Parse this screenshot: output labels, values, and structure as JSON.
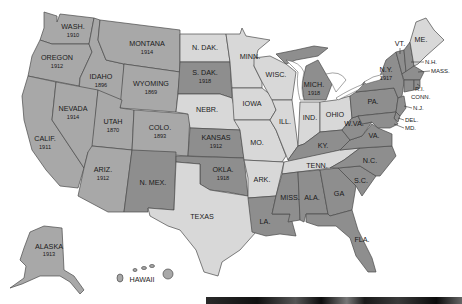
{
  "colors": {
    "full_suffrage": "#a8a8a8",
    "later_suffrage": "#8e8e8e",
    "no_suffrage": "#d8d8d8",
    "border": "#4a4a4a",
    "water": "#ffffff"
  },
  "states": {
    "wash": {
      "label": "WASH.",
      "year": "1910"
    },
    "oregon": {
      "label": "OREGON",
      "year": "1912"
    },
    "calif": {
      "label": "CALIF.",
      "year": "1911"
    },
    "idaho": {
      "label": "IDAHO",
      "year": "1896"
    },
    "nevada": {
      "label": "NEVADA",
      "year": "1914"
    },
    "montana": {
      "label": "MONTANA",
      "year": "1914"
    },
    "wyoming": {
      "label": "WYOMING",
      "year": "1869"
    },
    "utah": {
      "label": "UTAH",
      "year": "1870"
    },
    "colo": {
      "label": "COLO.",
      "year": "1893"
    },
    "ariz": {
      "label": "ARIZ.",
      "year": "1912"
    },
    "nmex": {
      "label": "N. MEX."
    },
    "ndak": {
      "label": "N. DAK."
    },
    "sdak": {
      "label": "S. DAK.",
      "year": "1918"
    },
    "nebr": {
      "label": "NEBR."
    },
    "kansas": {
      "label": "KANSAS",
      "year": "1912"
    },
    "okla": {
      "label": "OKLA.",
      "year": "1918"
    },
    "texas": {
      "label": "TEXAS"
    },
    "minn": {
      "label": "MINN."
    },
    "iowa": {
      "label": "IOWA"
    },
    "mo": {
      "label": "MO."
    },
    "ark": {
      "label": "ARK."
    },
    "la": {
      "label": "LA."
    },
    "wisc": {
      "label": "WISC."
    },
    "ill": {
      "label": "ILL."
    },
    "mich": {
      "label": "MICH.",
      "year": "1918"
    },
    "ind": {
      "label": "IND."
    },
    "ohio": {
      "label": "OHIO"
    },
    "ky": {
      "label": "KY."
    },
    "tenn": {
      "label": "TENN."
    },
    "miss": {
      "label": "MISS."
    },
    "ala": {
      "label": "ALA."
    },
    "ga": {
      "label": "GA"
    },
    "fla": {
      "label": "FLA."
    },
    "sc": {
      "label": "S.C."
    },
    "nc": {
      "label": "N.C."
    },
    "va": {
      "label": "VA."
    },
    "wva": {
      "label": "W.VA."
    },
    "pa": {
      "label": "PA."
    },
    "ny": {
      "label": "N.Y.",
      "year": "1917"
    },
    "vt": {
      "label": "VT."
    },
    "nh": {
      "label": "N.H."
    },
    "me": {
      "label": "ME."
    },
    "mass": {
      "label": "MASS."
    },
    "ri": {
      "label": "R.I."
    },
    "conn": {
      "label": "CONN."
    },
    "nj": {
      "label": "N.J."
    },
    "del": {
      "label": "DEL."
    },
    "md": {
      "label": "MD."
    },
    "alaska": {
      "label": "ALASKA",
      "year": "1913"
    },
    "hawaii": {
      "label": "HAWAII"
    }
  }
}
